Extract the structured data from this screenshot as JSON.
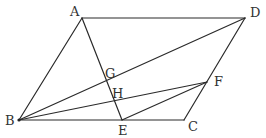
{
  "figure": {
    "type": "parallelogram-geometry",
    "points": {
      "A": {
        "label": "A",
        "x": 82,
        "y": 18,
        "label_x": 70,
        "label_y": 16
      },
      "D": {
        "label": "D",
        "x": 245,
        "y": 18,
        "label_x": 250,
        "label_y": 17
      },
      "B": {
        "label": "B",
        "x": 19,
        "y": 120,
        "label_x": 5,
        "label_y": 125
      },
      "C": {
        "label": "C",
        "x": 184,
        "y": 120,
        "label_x": 188,
        "label_y": 131
      },
      "E": {
        "label": "E",
        "x": 122,
        "y": 120,
        "label_x": 118,
        "label_y": 135
      },
      "F": {
        "label": "F",
        "x": 207,
        "y": 82,
        "label_x": 214,
        "label_y": 86
      },
      "G": {
        "label": "G",
        "x": 108,
        "y": 84,
        "label_x": 105,
        "label_y": 78
      },
      "H": {
        "label": "H",
        "x": 114,
        "y": 101,
        "label_x": 112,
        "label_y": 98
      }
    },
    "segments": [
      {
        "name": "AB",
        "from": "A",
        "to": "B"
      },
      {
        "name": "AD",
        "from": "A",
        "to": "D"
      },
      {
        "name": "DC",
        "from": "D",
        "to": "C"
      },
      {
        "name": "BC",
        "from": "B",
        "to": "C"
      },
      {
        "name": "AE",
        "from": "A",
        "to": "E"
      },
      {
        "name": "BD",
        "from": "B",
        "to": "D"
      },
      {
        "name": "BF",
        "from": "B",
        "to": "F"
      },
      {
        "name": "EF",
        "from": "E",
        "to": "F"
      }
    ],
    "line_color": "#2a2a2a",
    "label_color": "#333333"
  }
}
